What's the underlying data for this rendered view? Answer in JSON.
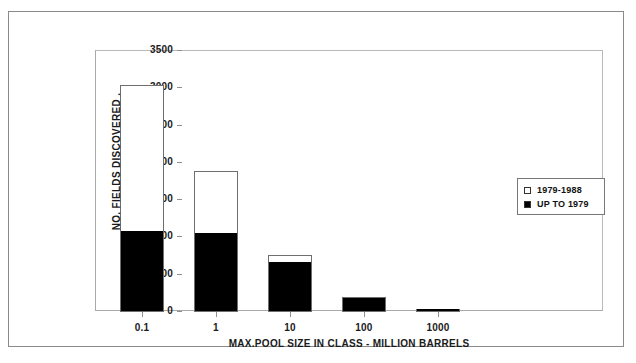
{
  "chart_data": {
    "type": "bar",
    "title": "",
    "subtitle": "",
    "xlabel": "MAX.POOL SIZE IN CLASS - MILLION BARRELS",
    "ylabel": "NO. FIELDS DISCOVERED  .",
    "categories": [
      "0.1",
      "1",
      "10",
      "100",
      "1000"
    ],
    "series": [
      {
        "name": "UP TO 1979",
        "color": "#000000",
        "values": [
          1073,
          1046,
          657,
          174,
          27
        ]
      },
      {
        "name": "1979-1988",
        "color": "#ffffff",
        "values": [
          1972,
          845,
          107,
          27,
          13
        ]
      }
    ],
    "totals": [
      3045,
      1891,
      764,
      201,
      40
    ],
    "stacked": true,
    "ylim": [
      0,
      3500
    ],
    "yticks": [
      0,
      500,
      1000,
      1500,
      2000,
      2500,
      3000,
      3500
    ],
    "ytick_labels": [
      "0",
      "500",
      "1000",
      "1500",
      "2000",
      "2500",
      "3000",
      "3500"
    ],
    "grid": false,
    "legend_position": "inside-right"
  },
  "legend": {
    "entries": [
      {
        "label": "1979-1988",
        "swatch": "hollow"
      },
      {
        "label": "UP TO 1979",
        "swatch": "filled"
      }
    ]
  },
  "colors": {
    "bar_fill_old": "#000000",
    "bar_fill_new": "#ffffff",
    "bar_outline": "#6e6e6e",
    "axis": "#8f8f8f",
    "frame": "#8a8a8a",
    "text": "#1a1a1a",
    "background": "#ffffff"
  }
}
